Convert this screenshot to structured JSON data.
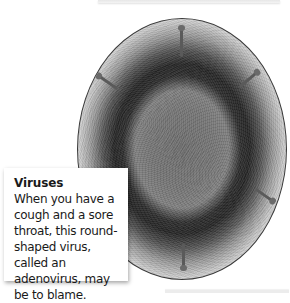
{
  "figure": {
    "image_alt": "Round-shaped adenovirus under an electron microscope"
  },
  "caption": {
    "title": "Viruses",
    "body": "When you have a cough and a sore throat, this round-shaped virus, called an adenovirus, may be to blame."
  },
  "colors": {
    "circle_border": "#3a3a3a",
    "caption_text": "#1a1a1a",
    "background": "#ffffff"
  }
}
